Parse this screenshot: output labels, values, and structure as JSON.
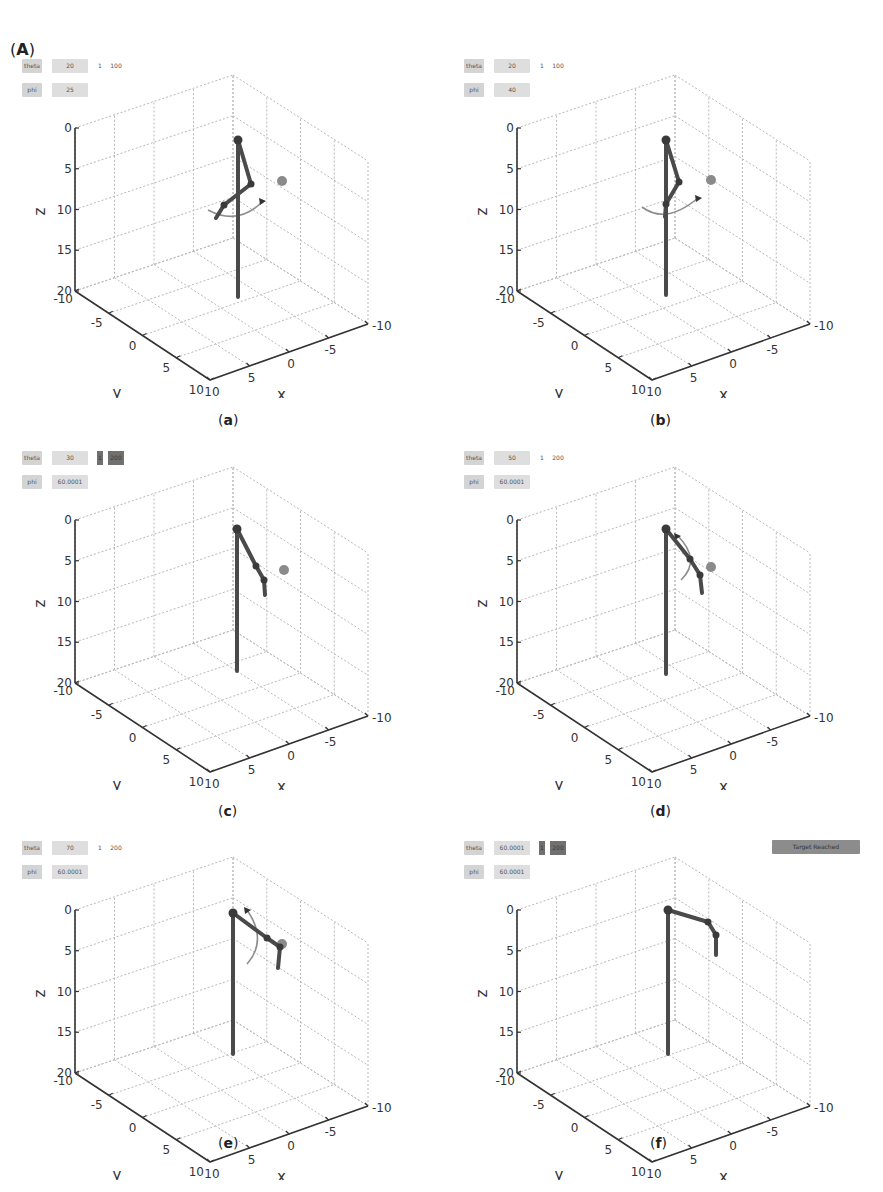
{
  "figure": {
    "label": "A"
  },
  "chart_data": [
    {
      "id": "a",
      "type": "scatter3d",
      "caption": "a",
      "controls": {
        "theta": "20",
        "phi": "25",
        "step": "1",
        "max": "100",
        "step_active": false
      },
      "status": null,
      "xlim": [
        -10,
        10
      ],
      "ylim": [
        -10,
        10
      ],
      "zlim": [
        0,
        20
      ],
      "xlabel": "x",
      "ylabel": "y",
      "zlabel": "z",
      "xticks": [
        "10",
        "5",
        "0",
        "-5",
        "-10"
      ],
      "yticks": [
        "-10",
        "-5",
        "0",
        "5",
        "10"
      ],
      "zticks": [
        "0",
        "5",
        "10",
        "15",
        "20"
      ],
      "grid": true,
      "target": {
        "note": "grey marker near x=-3, y=-4, z=7"
      },
      "arm_pose": "folded, rotation arc shown at mid-height"
    },
    {
      "id": "b",
      "type": "scatter3d",
      "caption": "b",
      "controls": {
        "theta": "20",
        "phi": "40",
        "step": "1",
        "max": "100",
        "step_active": false
      },
      "status": null,
      "xlim": [
        -10,
        10
      ],
      "ylim": [
        -10,
        10
      ],
      "zlim": [
        0,
        20
      ],
      "xlabel": "x",
      "ylabel": "y",
      "zlabel": "z",
      "xticks": [
        "10",
        "5",
        "0",
        "-5",
        "-10"
      ],
      "yticks": [
        "-10",
        "-5",
        "0",
        "5",
        "10"
      ],
      "zticks": [
        "0",
        "5",
        "10",
        "15",
        "20"
      ],
      "grid": true,
      "arm_pose": "folded, rotation arc shown at mid-height"
    },
    {
      "id": "c",
      "type": "scatter3d",
      "caption": "c",
      "controls": {
        "theta": "30",
        "phi": "60.0001",
        "step": "1",
        "max": "200",
        "step_active": true
      },
      "status": null,
      "xlim": [
        -10,
        10
      ],
      "ylim": [
        -10,
        10
      ],
      "zlim": [
        0,
        20
      ],
      "xlabel": "x",
      "ylabel": "y",
      "zlabel": "z",
      "xticks": [
        "10",
        "5",
        "0",
        "-5",
        "-10"
      ],
      "yticks": [
        "-10",
        "-5",
        "0",
        "5",
        "10"
      ],
      "zticks": [
        "0",
        "5",
        "10",
        "15",
        "20"
      ],
      "grid": true,
      "arm_pose": "extended toward target"
    },
    {
      "id": "d",
      "type": "scatter3d",
      "caption": "d",
      "controls": {
        "theta": "50",
        "phi": "60.0001",
        "step": "1",
        "max": "200",
        "step_active": false
      },
      "status": null,
      "xlim": [
        -10,
        10
      ],
      "ylim": [
        -10,
        10
      ],
      "zlim": [
        0,
        20
      ],
      "xlabel": "x",
      "ylabel": "y",
      "zlabel": "z",
      "xticks": [
        "10",
        "5",
        "0",
        "-5",
        "-10"
      ],
      "yticks": [
        "-10",
        "-5",
        "0",
        "5",
        "10"
      ],
      "zticks": [
        "0",
        "5",
        "10",
        "15",
        "20"
      ],
      "grid": true,
      "arm_pose": "extended, rotation arc shown near top"
    },
    {
      "id": "e",
      "type": "scatter3d",
      "caption": "e",
      "controls": {
        "theta": "70",
        "phi": "60.0001",
        "step": "1",
        "max": "200",
        "step_active": false
      },
      "status": null,
      "xlim": [
        -10,
        10
      ],
      "ylim": [
        -10,
        10
      ],
      "zlim": [
        0,
        20
      ],
      "xlabel": "x",
      "ylabel": "y",
      "zlabel": "z",
      "xticks": [
        "10",
        "5",
        "0",
        "-5",
        "-10"
      ],
      "yticks": [
        "-10",
        "-5",
        "0",
        "5",
        "10"
      ],
      "zticks": [
        "0",
        "5",
        "10",
        "15",
        "20"
      ],
      "grid": true,
      "arm_pose": "near target, rotation arc shown"
    },
    {
      "id": "f",
      "type": "scatter3d",
      "caption": "f",
      "controls": {
        "theta": "60.0001",
        "phi": "60.0001",
        "step": "1",
        "max": "200",
        "step_active": true
      },
      "status": "Target Reached",
      "xlim": [
        -10,
        10
      ],
      "ylim": [
        -10,
        10
      ],
      "zlim": [
        0,
        20
      ],
      "xlabel": "x",
      "ylabel": "y",
      "zlabel": "z",
      "xticks": [
        "10",
        "5",
        "0",
        "-5",
        "-10"
      ],
      "yticks": [
        "-10",
        "-5",
        "0",
        "5",
        "10"
      ],
      "zticks": [
        "0",
        "5",
        "10",
        "15",
        "20"
      ],
      "grid": true,
      "arm_pose": "end effector at target"
    }
  ],
  "labels": {
    "theta": "theta",
    "phi": "phi"
  },
  "colors": {
    "arm": "#4a4a4a",
    "joint": "#3a3a3a",
    "target": "#8a8a8a",
    "grid": "#b8b8b8",
    "axis": "#333333",
    "arc": "#8c8c8c"
  }
}
